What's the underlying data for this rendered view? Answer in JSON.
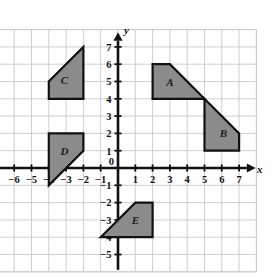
{
  "chart_data": {
    "type": "scatter",
    "title": "",
    "xlabel": "x",
    "ylabel": "y",
    "grid": true,
    "legend": "none",
    "xlim": [
      -7,
      8
    ],
    "ylim": [
      -6,
      8
    ],
    "x_ticks": [
      -6,
      -5,
      -4,
      -3,
      -2,
      -1,
      0,
      1,
      2,
      3,
      4,
      5,
      6,
      7
    ],
    "y_ticks": [
      -5,
      -4,
      -3,
      -2,
      -1,
      1,
      2,
      3,
      4,
      5,
      6,
      7
    ],
    "x_tick_labels": [
      "-6",
      "-5",
      "-4",
      "-3",
      "-2",
      "-1",
      "0",
      "1",
      "2",
      "3",
      "4",
      "5",
      "6",
      "7"
    ],
    "y_tick_labels": [
      "-5",
      "-4",
      "-3",
      "-2",
      "-1",
      "1",
      "2",
      "3",
      "4",
      "5",
      "6",
      "7"
    ],
    "origin_label": "0",
    "shapes": [
      {
        "name": "A",
        "label": "A",
        "vertices": [
          [
            2,
            4
          ],
          [
            2,
            6
          ],
          [
            3,
            6
          ],
          [
            5,
            4
          ]
        ],
        "label_at": [
          3.0,
          5.0
        ],
        "fill": "#8b8b8b",
        "stroke": "#111111"
      },
      {
        "name": "B",
        "label": "B",
        "vertices": [
          [
            5,
            1
          ],
          [
            5,
            4
          ],
          [
            7,
            2
          ],
          [
            7,
            1
          ]
        ],
        "label_at": [
          6.1,
          2.0
        ],
        "fill": "#8b8b8b",
        "stroke": "#111111"
      },
      {
        "name": "C",
        "label": "C",
        "vertices": [
          [
            -4,
            4
          ],
          [
            -4,
            5
          ],
          [
            -2,
            7
          ],
          [
            -2,
            4
          ]
        ],
        "label_at": [
          -3.1,
          5.1
        ],
        "fill": "#8b8b8b",
        "stroke": "#111111"
      },
      {
        "name": "D",
        "label": "D",
        "vertices": [
          [
            -4,
            -1
          ],
          [
            -4,
            2
          ],
          [
            -2,
            2
          ],
          [
            -2,
            1
          ]
        ],
        "label_at": [
          -3.1,
          1.0
        ],
        "fill": "#8b8b8b",
        "stroke": "#111111"
      },
      {
        "name": "E",
        "label": "E",
        "vertices": [
          [
            -1,
            -4
          ],
          [
            1,
            -2
          ],
          [
            2,
            -2
          ],
          [
            2,
            -4
          ]
        ],
        "label_at": [
          1.0,
          -3.0
        ],
        "fill": "#8b8b8b",
        "stroke": "#111111"
      }
    ]
  },
  "axes": {
    "x_axis_name": "x",
    "y_axis_name": "y"
  },
  "colors": {
    "grid": "#c9c9cf",
    "axis": "#111111",
    "shape_fill": "#8b8b8b",
    "shape_stroke": "#111111",
    "background": "#ffffff"
  }
}
